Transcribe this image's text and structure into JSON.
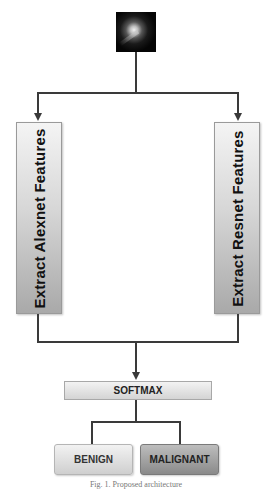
{
  "diagram": {
    "input_image": {
      "label": "input-lesion-image"
    },
    "branches": {
      "left": {
        "label": "Extract Alexnet Features"
      },
      "right": {
        "label": "Extract Resnet Features"
      }
    },
    "fusion": {
      "label": "SOFTMAX"
    },
    "outputs": [
      {
        "label": "BENIGN"
      },
      {
        "label": "MALIGNANT"
      }
    ],
    "caption": "Fig. 1. Proposed architecture"
  },
  "colors": {
    "line": "#3a3a3a",
    "box_light": "#d7d7d7",
    "box_dark": "#8a8a8a"
  }
}
